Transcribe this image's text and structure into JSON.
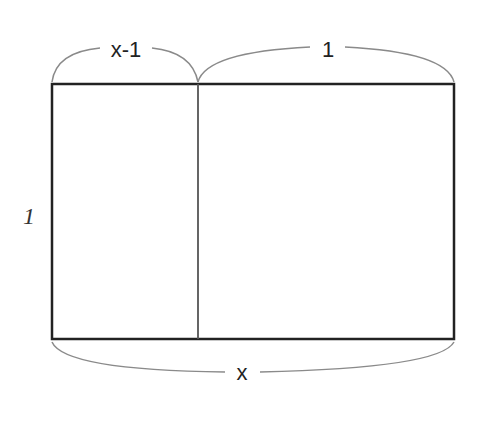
{
  "diagram": {
    "type": "rectangle-area-model",
    "rectangle": {
      "x": 52,
      "y": 84,
      "width": 402,
      "height": 255,
      "stroke": "#222222"
    },
    "divider": {
      "x": 198,
      "stroke": "#555555"
    },
    "brace_color": "#8a8a8a",
    "labels": {
      "top_left": "x-1",
      "top_right": "1",
      "left_side": "1",
      "bottom": "x"
    }
  }
}
